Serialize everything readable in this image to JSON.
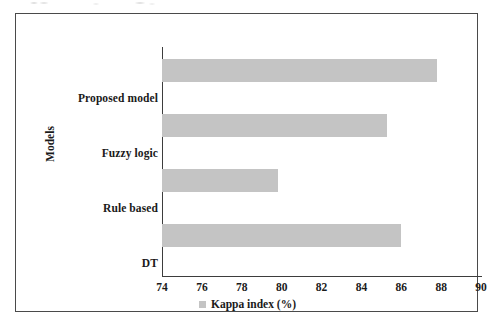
{
  "figure": {
    "frame_border_color": "#4a4a4a",
    "background_color": "#ffffff"
  },
  "chart_data": {
    "type": "bar",
    "orientation": "horizontal",
    "title": "",
    "xlabel": "",
    "ylabel": "Models",
    "categories": [
      "Proposed model",
      "Fuzzy logic",
      "Rule based",
      "DT"
    ],
    "values": [
      87.8,
      85.3,
      79.8,
      86.0
    ],
    "series": [
      {
        "name": "Kappa index (%)",
        "color": "#c4c4c4",
        "values": [
          87.8,
          85.3,
          79.8,
          86.0
        ]
      }
    ],
    "xlim": [
      74,
      90
    ],
    "xticks": [
      74,
      76,
      78,
      80,
      82,
      84,
      86,
      88,
      90
    ],
    "xtick_labels": [
      "74",
      "76",
      "78",
      "80",
      "82",
      "84",
      "86",
      "88",
      "90"
    ],
    "grid": false,
    "legend": {
      "position": "bottom",
      "entries": [
        "Kappa index (%)"
      ]
    }
  }
}
